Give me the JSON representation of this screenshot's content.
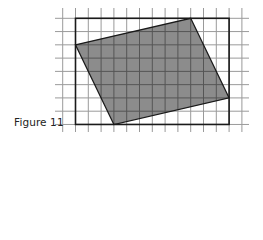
{
  "caption": "Figure 11",
  "grid": {
    "origin_x": 62.7,
    "origin_y": 18.3,
    "cell_w": 12.8,
    "cell_h": 13.27,
    "columns": 15,
    "rows": 9,
    "line_x_extent": [
      55,
      249
    ],
    "line_y_extent": [
      8,
      132
    ],
    "line_color": "#9a9a9a",
    "line_color_inside": "#555555"
  },
  "rectangle": {
    "col_start": 1,
    "col_end": 13,
    "row_start": 0,
    "row_end": 8,
    "stroke": "#1a1a1a"
  },
  "parallelogram": {
    "vertices_grid": [
      [
        1,
        2
      ],
      [
        10,
        0
      ],
      [
        13,
        6
      ],
      [
        4,
        8
      ]
    ],
    "fill": "#8c8c8c",
    "stroke": "#1a1a1a"
  }
}
